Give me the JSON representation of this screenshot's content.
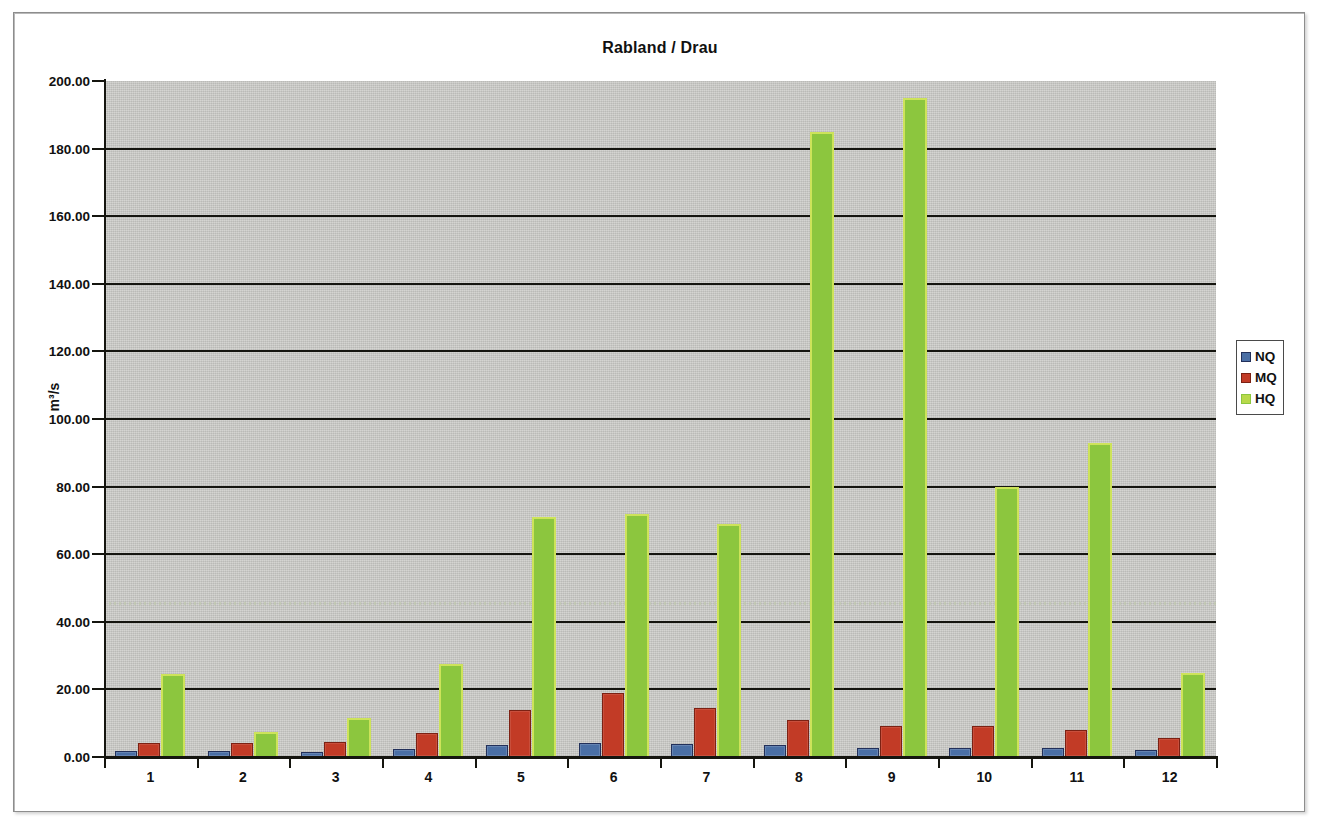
{
  "frame": {
    "border_color": "#8d8d8d"
  },
  "chart_data": {
    "type": "bar",
    "title": "Rabland / Drau",
    "xlabel": "",
    "ylabel": "m³/s",
    "categories": [
      "1",
      "2",
      "3",
      "4",
      "5",
      "6",
      "7",
      "8",
      "9",
      "10",
      "11",
      "12"
    ],
    "ylim": [
      0,
      200
    ],
    "ytick_labels": [
      "200.00",
      "180.00",
      "160.00",
      "140.00",
      "120.00",
      "100.00",
      "80.00",
      "60.00",
      "40.00",
      "20.00",
      "0.00"
    ],
    "ytick_values": [
      200,
      180,
      160,
      140,
      120,
      100,
      80,
      60,
      40,
      20,
      0
    ],
    "ytick_step": 20,
    "grid": true,
    "legend_position": "right",
    "plot_background": "#c9c9c6",
    "series": [
      {
        "name": "NQ",
        "color": "#4a6fa5",
        "values": [
          1.8,
          1.8,
          1.4,
          2.5,
          3.5,
          4.2,
          3.8,
          3.5,
          2.7,
          2.8,
          2.8,
          2.0
        ]
      },
      {
        "name": "MQ",
        "color": "#c23b26",
        "values": [
          4.2,
          4.0,
          4.3,
          7.0,
          14.0,
          19.0,
          14.5,
          11.0,
          9.3,
          9.3,
          8.0,
          5.5
        ]
      },
      {
        "name": "HQ",
        "color": "#8cc63e",
        "values": [
          24.5,
          7.5,
          11.5,
          27.5,
          71.0,
          72.0,
          69.0,
          185.0,
          195.0,
          80.0,
          93.0,
          25.0
        ]
      }
    ],
    "annotations": [
      {
        "type": "reference-line",
        "value": 45.5,
        "style": "dotted",
        "label": ""
      }
    ]
  }
}
